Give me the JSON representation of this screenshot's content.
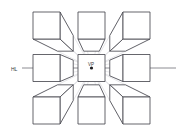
{
  "figure": {
    "type": "perspective-diagram",
    "background_color": "#ffffff",
    "canvas": {
      "width": 183,
      "height": 136
    }
  },
  "labels": {
    "horizon_line": "HL",
    "vanishing_point": "VP"
  },
  "colors": {
    "cube_stroke": "#4a4a52",
    "cube_fill": "#ffffff",
    "guide_line": "#c9c9cf",
    "horizon_line": "#6e6e76",
    "vanishing_point_dot": "#1c1c20",
    "label": "#3a3a3a"
  },
  "geometry": {
    "vanishing_point": {
      "x": 91.5,
      "y": 68
    },
    "horizon_line": {
      "x1": 22,
      "x2": 176,
      "y": 68
    },
    "front_face_size": 27,
    "label_positions": {
      "hl": {
        "x": 11,
        "y": 70.5
      },
      "vp": {
        "x": 88,
        "y": 66
      }
    }
  },
  "cubes": [
    {
      "id": "cube-top-left",
      "name": "cube-top-left",
      "row": "top",
      "column": "left",
      "front_face": {
        "x": 33,
        "y": 12,
        "w": 27,
        "h": 27
      },
      "visible_faces": [
        "front",
        "right",
        "bottom"
      ],
      "position_relative_to_vp": "above-left"
    },
    {
      "id": "cube-top-center",
      "name": "cube-top-center",
      "row": "top",
      "column": "center",
      "front_face": {
        "x": 78,
        "y": 12,
        "w": 27,
        "h": 27
      },
      "visible_faces": [
        "front",
        "bottom"
      ],
      "position_relative_to_vp": "directly-above"
    },
    {
      "id": "cube-top-right",
      "name": "cube-top-right",
      "row": "top",
      "column": "right",
      "front_face": {
        "x": 123,
        "y": 12,
        "w": 27,
        "h": 27
      },
      "visible_faces": [
        "front",
        "left",
        "bottom"
      ],
      "position_relative_to_vp": "above-right"
    },
    {
      "id": "cube-middle-left",
      "name": "cube-middle-left",
      "row": "middle",
      "column": "left",
      "front_face": {
        "x": 33,
        "y": 54.5,
        "w": 27,
        "h": 27
      },
      "visible_faces": [
        "front",
        "right"
      ],
      "position_relative_to_vp": "left-on-horizon"
    },
    {
      "id": "cube-middle-center",
      "name": "cube-center-at-vanishing-point",
      "row": "middle",
      "column": "center",
      "front_face": {
        "x": 78,
        "y": 54.5,
        "w": 27,
        "h": 27
      },
      "visible_faces": [
        "front"
      ],
      "position_relative_to_vp": "centered-on-vp"
    },
    {
      "id": "cube-middle-right",
      "name": "cube-middle-right",
      "row": "middle",
      "column": "right",
      "front_face": {
        "x": 123,
        "y": 54.5,
        "w": 27,
        "h": 27
      },
      "visible_faces": [
        "front",
        "left"
      ],
      "position_relative_to_vp": "right-on-horizon"
    },
    {
      "id": "cube-bottom-left",
      "name": "cube-bottom-left",
      "row": "bottom",
      "column": "left",
      "front_face": {
        "x": 33,
        "y": 97,
        "w": 27,
        "h": 27
      },
      "visible_faces": [
        "front",
        "right",
        "top"
      ],
      "position_relative_to_vp": "below-left"
    },
    {
      "id": "cube-bottom-center",
      "name": "cube-bottom-center",
      "row": "bottom",
      "column": "center",
      "front_face": {
        "x": 78,
        "y": 97,
        "w": 27,
        "h": 27
      },
      "visible_faces": [
        "front",
        "top"
      ],
      "position_relative_to_vp": "directly-below"
    },
    {
      "id": "cube-bottom-right",
      "name": "cube-bottom-right",
      "row": "bottom",
      "column": "right",
      "front_face": {
        "x": 123,
        "y": 97,
        "w": 27,
        "h": 27
      },
      "visible_faces": [
        "front",
        "left",
        "top"
      ],
      "position_relative_to_vp": "below-right"
    }
  ]
}
